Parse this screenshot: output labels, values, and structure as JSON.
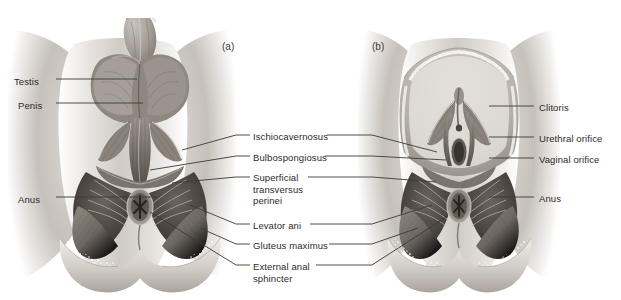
{
  "figure": {
    "background_color": "#ffffff",
    "line_color": "#3a3a3a",
    "text_color": "#2b2b2b",
    "width": 621,
    "height": 300
  },
  "panels": [
    {
      "id": "a",
      "label": "(a)",
      "subject": "male perineum",
      "x": 222,
      "y": 41
    },
    {
      "id": "b",
      "label": "(b)",
      "subject": "female perineum",
      "x": 372,
      "y": 41
    }
  ],
  "labels_left": [
    {
      "id": "testis",
      "text": "Testis",
      "x": 14,
      "y": 76,
      "leader_from_x": 56,
      "leader_to_x": 137,
      "leader_y": 79
    },
    {
      "id": "penis",
      "text": "Penis",
      "x": 18,
      "y": 100,
      "leader_from_x": 56,
      "leader_to_x": 143,
      "leader_y": 103
    },
    {
      "id": "anus-male",
      "text": "Anus",
      "x": 18,
      "y": 194,
      "leader_from_x": 56,
      "leader_to_x": 158,
      "leader_y": 197
    }
  ],
  "labels_center": [
    {
      "id": "ischiocavernosus",
      "text": "Ischiocavernosus",
      "x": 253,
      "y": 131,
      "leader_left_from_x": 236,
      "leader_left_to_x": 250,
      "leader_left_y": 135,
      "leader_right_from_x": 327,
      "leader_right_to_x": 372,
      "leader_right_y": 135,
      "target_left_x": 182,
      "target_left_y": 150,
      "target_right_x": 415,
      "target_right_y": 152
    },
    {
      "id": "bulbospongiosus",
      "text": "Bulbospongiosus",
      "x": 253,
      "y": 152,
      "leader_left_from_x": 236,
      "leader_left_to_x": 250,
      "leader_left_y": 156,
      "leader_right_from_x": 325,
      "leader_right_to_x": 372,
      "leader_right_y": 156,
      "target_left_x": 176,
      "target_left_y": 172,
      "target_right_x": 423,
      "target_right_y": 170
    },
    {
      "id": "superficial-transversus-perinei",
      "text": "Superficial\ntransversus\nperinei",
      "x": 253,
      "y": 172,
      "leader_left_from_x": 236,
      "leader_left_to_x": 250,
      "leader_left_y": 177,
      "leader_right_from_x": 308,
      "leader_right_to_x": 372,
      "leader_right_y": 177,
      "target_left_x": 172,
      "target_left_y": 183,
      "target_right_x": 418,
      "target_right_y": 182
    },
    {
      "id": "levator-ani",
      "text": "Levator ani",
      "x": 253,
      "y": 220,
      "leader_left_from_x": 236,
      "leader_left_to_x": 250,
      "leader_left_y": 224,
      "leader_right_from_x": 310,
      "leader_right_to_x": 372,
      "leader_right_y": 224,
      "target_left_x": 186,
      "target_left_y": 206,
      "target_right_x": 432,
      "target_right_y": 205
    },
    {
      "id": "gluteus-maximus",
      "text": "Gluteus maximus",
      "x": 253,
      "y": 240,
      "leader_left_from_x": 236,
      "leader_left_to_x": 250,
      "leader_left_y": 244,
      "leader_right_from_x": 329,
      "leader_right_to_x": 372,
      "leader_right_y": 244,
      "target_left_x": 196,
      "target_left_y": 224,
      "target_right_x": 440,
      "target_right_y": 226
    },
    {
      "id": "external-anal-sphincter",
      "text": "External anal\nsphincter",
      "x": 253,
      "y": 261,
      "leader_left_from_x": 236,
      "leader_left_to_x": 250,
      "leader_left_y": 265,
      "leader_right_from_x": 316,
      "leader_right_to_x": 372,
      "leader_right_y": 265,
      "target_left_x": 178,
      "target_left_y": 213,
      "target_right_x": 432,
      "target_right_y": 216
    }
  ],
  "labels_right": [
    {
      "id": "clitoris",
      "text": "Clitoris",
      "x": 539,
      "y": 102,
      "leader_from_x": 489,
      "leader_to_x": 534,
      "leader_y": 106
    },
    {
      "id": "urethral-orifice",
      "text": "Urethral orifice",
      "x": 539,
      "y": 133,
      "leader_from_x": 489,
      "leader_to_x": 534,
      "leader_y": 137
    },
    {
      "id": "vaginal-orifice",
      "text": "Vaginal orifice",
      "x": 539,
      "y": 154,
      "leader_from_x": 489,
      "leader_to_x": 534,
      "leader_y": 158
    },
    {
      "id": "anus-female",
      "text": "Anus",
      "x": 539,
      "y": 193,
      "leader_from_x": 489,
      "leader_to_x": 534,
      "leader_y": 197
    }
  ]
}
